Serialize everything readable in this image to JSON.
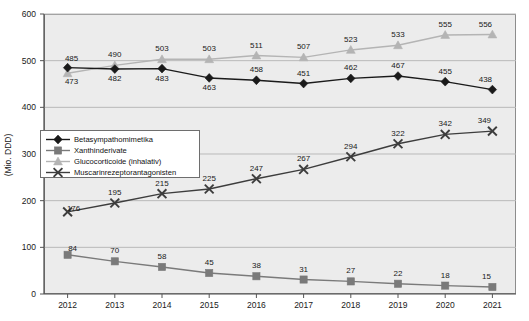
{
  "axis": {
    "ylabel": "(Mio. DDD)",
    "yticks": [
      "0",
      "100",
      "200",
      "300",
      "400",
      "500",
      "600"
    ],
    "xticks": [
      "2012",
      "2013",
      "2014",
      "2015",
      "2016",
      "2017",
      "2018",
      "2019",
      "2020",
      "2021"
    ]
  },
  "legend": {
    "items": [
      {
        "label": "Betasympathomimetika",
        "marker": "diamond-marker-icon",
        "color": "#1a1a1a"
      },
      {
        "label": "Xanthinderivate",
        "marker": "square-marker-icon",
        "color": "#7a7a7a"
      },
      {
        "label": "Glucocorticoide (inhalativ)",
        "marker": "triangle-marker-icon",
        "color": "#b4b4b4"
      },
      {
        "label": "Muscarinrezeptorantagonisten",
        "marker": "x-marker-icon",
        "color": "#3d3d3d"
      }
    ]
  },
  "chart_data": {
    "type": "line",
    "title": "",
    "xlabel": "",
    "ylabel": "(Mio. DDD)",
    "ylim": [
      0,
      600
    ],
    "ytick_step": 100,
    "grid": true,
    "legend_position": "inside-left",
    "categories": [
      "2012",
      "2013",
      "2014",
      "2015",
      "2016",
      "2017",
      "2018",
      "2019",
      "2020",
      "2021"
    ],
    "series": [
      {
        "name": "Betasympathomimetika",
        "color": "#1a1a1a",
        "marker": "diamond",
        "label_side": "mixed",
        "values": [
          485,
          482,
          483,
          463,
          458,
          451,
          462,
          467,
          455,
          438
        ]
      },
      {
        "name": "Xanthinderivate",
        "color": "#7a7a7a",
        "marker": "square",
        "label_side": "above",
        "values": [
          84,
          70,
          58,
          45,
          38,
          31,
          27,
          22,
          18,
          15
        ]
      },
      {
        "name": "Glucocorticoide (inhalativ)",
        "color": "#b4b4b4",
        "marker": "triangle",
        "label_side": "above",
        "values": [
          473,
          490,
          503,
          503,
          511,
          507,
          523,
          533,
          555,
          556
        ]
      },
      {
        "name": "Muscarinrezeptorantagonisten",
        "color": "#3d3d3d",
        "marker": "x",
        "label_side": "above",
        "values": [
          176,
          195,
          215,
          225,
          247,
          267,
          294,
          322,
          342,
          349
        ]
      }
    ],
    "data_labels": {
      "Betasympathomimetika": [
        "485",
        "482",
        "483",
        "463",
        "458",
        "451",
        "462",
        "467",
        "455",
        "438"
      ],
      "Xanthinderivate": [
        "84",
        "70",
        "58",
        "45",
        "38",
        "31",
        "27",
        "22",
        "18",
        "15"
      ],
      "Glucocorticoide (inhalativ)": [
        "473",
        "490",
        "503",
        "503",
        "511",
        "507",
        "523",
        "533",
        "555",
        "556"
      ],
      "Muscarinrezeptorantagonisten": [
        "176",
        "195",
        "215",
        "225",
        "247",
        "267",
        "294",
        "322",
        "342",
        "349"
      ]
    }
  }
}
